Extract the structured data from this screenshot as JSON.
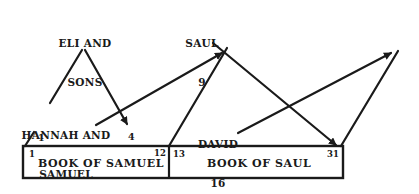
{
  "nodes": {
    "eli": {
      "line1": "ELI AND",
      "line2": "SONS"
    },
    "saul": {
      "line1": "SAUL",
      "line2": "9"
    },
    "hannah": {
      "line1": "HANNAH AND",
      "line2": "SAMUEL"
    },
    "david": {
      "line1": "DAVID",
      "line2": "16"
    }
  },
  "markers": {
    "hannah_start": "1",
    "eli_arrow_end": "4"
  },
  "books": [
    {
      "title": "BOOK OF SAMUEL",
      "start_chapter": "1",
      "end_chapter": "12"
    },
    {
      "title": "BOOK OF SAUL",
      "start_chapter": "13",
      "end_chapter": "31"
    }
  ],
  "colors": {
    "ink": "#1a1a1a",
    "background": "#ffffff"
  }
}
